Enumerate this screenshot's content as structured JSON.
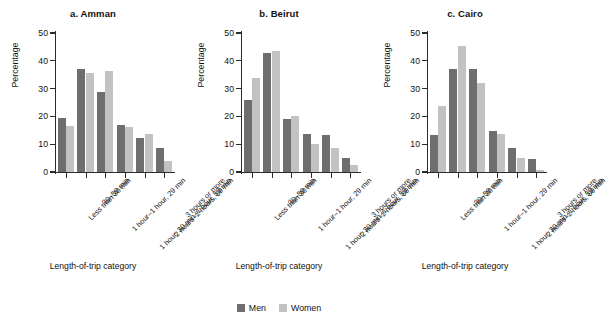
{
  "chart_data": [
    {
      "type": "bar",
      "title": "a. Amman",
      "xlabel": "Length-of-trip category",
      "ylabel": "Percentage",
      "ylim": [
        0,
        50
      ],
      "yticks": [
        0,
        10,
        20,
        30,
        40,
        50
      ],
      "grid": false,
      "legend_position": "bottom-center",
      "categories": [
        "Less than 30 min",
        "30–59 min",
        "1 hour–1 hour, 29 min",
        "1 hour, 30 min–1 hour, 59 min",
        "2 hours–2 hours, 59 min",
        "3 hours or more"
      ],
      "series": [
        {
          "name": "Men",
          "color": "#6e6e6e",
          "values": [
            19.5,
            37.0,
            28.7,
            16.8,
            12.2,
            8.8
          ]
        },
        {
          "name": "Women",
          "color": "#c2c2c2",
          "values": [
            16.7,
            35.5,
            36.2,
            16.3,
            13.5,
            4.0
          ]
        }
      ]
    },
    {
      "type": "bar",
      "title": "b. Beirut",
      "xlabel": "Length-of-trip category",
      "ylabel": "Percentage",
      "ylim": [
        0,
        50
      ],
      "yticks": [
        0,
        10,
        20,
        30,
        40,
        50
      ],
      "grid": false,
      "legend_position": "bottom-center",
      "categories": [
        "Less than 30 min",
        "30–59 min",
        "1 hour–1 hour, 29 min",
        "1 hour, 30 min–1 hour, 59 min",
        "2 hours–2 hours, 59 min",
        "3 hours or more"
      ],
      "series": [
        {
          "name": "Men",
          "color": "#6e6e6e",
          "values": [
            26.0,
            42.8,
            19.0,
            13.5,
            13.2,
            5.1
          ]
        },
        {
          "name": "Women",
          "color": "#c2c2c2",
          "values": [
            33.7,
            43.5,
            20.2,
            10.0,
            8.7,
            2.4
          ]
        }
      ]
    },
    {
      "type": "bar",
      "title": "c. Cairo",
      "xlabel": "Length-of-trip category",
      "ylabel": "Percentage",
      "ylim": [
        0,
        50
      ],
      "yticks": [
        0,
        10,
        20,
        30,
        40,
        50
      ],
      "grid": false,
      "legend_position": "bottom-center",
      "categories": [
        "Less than 30 min",
        "30–59 min",
        "1 hour–1 hour, 29 min",
        "1 hour, 30 min–1 hour, 59 min",
        "2 hours–2 hours, 59 min",
        "3 hours or more"
      ],
      "series": [
        {
          "name": "Men",
          "color": "#6e6e6e",
          "values": [
            13.2,
            37.2,
            37.2,
            14.8,
            8.7,
            4.7
          ]
        },
        {
          "name": "Women",
          "color": "#c2c2c2",
          "values": [
            23.8,
            45.3,
            32.0,
            13.6,
            5.1,
            0.8
          ]
        }
      ]
    }
  ],
  "legend": {
    "items": [
      {
        "label": "Men",
        "color": "#6e6e6e"
      },
      {
        "label": "Women",
        "color": "#c2c2c2"
      }
    ]
  }
}
